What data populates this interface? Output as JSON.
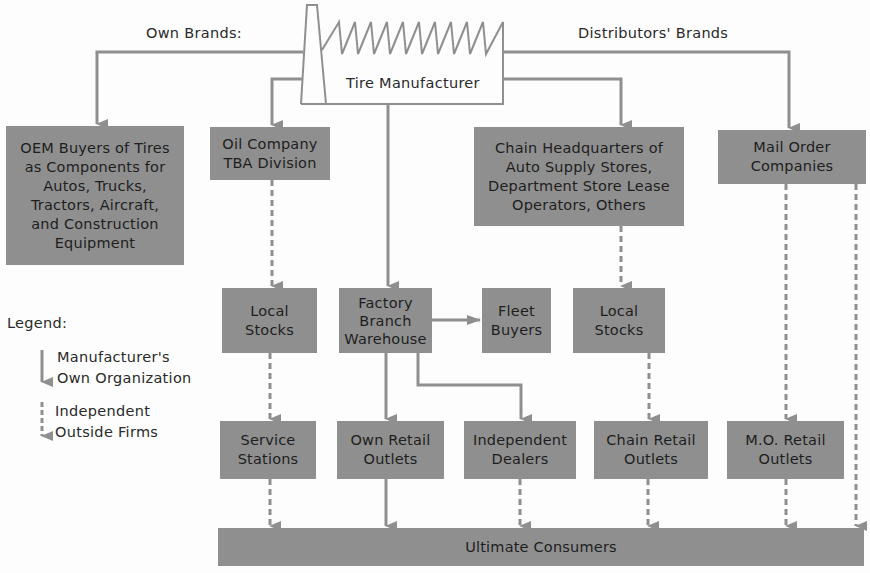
{
  "diagram": {
    "type": "flowchart",
    "colors": {
      "box_fill": "#8f8f8f",
      "line": "#8f8f8f",
      "text": "#2a2a2a",
      "background": "#fdfdfd"
    },
    "source": {
      "id": "tire-manufacturer",
      "label": "Tire Manufacturer",
      "icon": "factory-icon"
    },
    "branch_labels": {
      "own_brands": "Own Brands:",
      "distributors_brands": "Distributors' Brands"
    },
    "nodes": [
      {
        "id": "oem",
        "label": "OEM Buyers of Tires\nas Components for\nAutos, Trucks,\nTractors, Aircraft,\nand Construction\nEquipment"
      },
      {
        "id": "oil-company",
        "label": "Oil Company\nTBA Division"
      },
      {
        "id": "chain-hq",
        "label": "Chain Headquarters of\nAuto Supply Stores,\nDepartment Store Lease\nOperators, Others"
      },
      {
        "id": "mail-order",
        "label": "Mail Order\nCompanies"
      },
      {
        "id": "local-stocks-oil",
        "label": "Local\nStocks"
      },
      {
        "id": "factory-branch",
        "label": "Factory\nBranch\nWarehouse"
      },
      {
        "id": "fleet-buyers",
        "label": "Fleet\nBuyers"
      },
      {
        "id": "local-stocks-chain",
        "label": "Local\nStocks"
      },
      {
        "id": "service-stations",
        "label": "Service\nStations"
      },
      {
        "id": "own-retail",
        "label": "Own Retail\nOutlets"
      },
      {
        "id": "independent-dealers",
        "label": "Independent\nDealers"
      },
      {
        "id": "chain-retail",
        "label": "Chain Retail\nOutlets"
      },
      {
        "id": "mo-retail",
        "label": "M.O. Retail\nOutlets"
      },
      {
        "id": "ultimate-consumers",
        "label": "Ultimate Consumers"
      }
    ],
    "edges": [
      {
        "from": "tire-manufacturer",
        "to": "oem",
        "style": "solid",
        "group": "Own Brands"
      },
      {
        "from": "tire-manufacturer",
        "to": "oil-company",
        "style": "solid"
      },
      {
        "from": "tire-manufacturer",
        "to": "factory-branch",
        "style": "solid"
      },
      {
        "from": "tire-manufacturer",
        "to": "chain-hq",
        "style": "solid"
      },
      {
        "from": "tire-manufacturer",
        "to": "mail-order",
        "style": "solid",
        "group": "Distributors' Brands"
      },
      {
        "from": "oil-company",
        "to": "local-stocks-oil",
        "style": "dashed"
      },
      {
        "from": "local-stocks-oil",
        "to": "service-stations",
        "style": "dashed"
      },
      {
        "from": "factory-branch",
        "to": "fleet-buyers",
        "style": "solid"
      },
      {
        "from": "factory-branch",
        "to": "own-retail",
        "style": "solid"
      },
      {
        "from": "factory-branch",
        "to": "independent-dealers",
        "style": "solid"
      },
      {
        "from": "chain-hq",
        "to": "local-stocks-chain",
        "style": "dashed"
      },
      {
        "from": "local-stocks-chain",
        "to": "chain-retail",
        "style": "dashed"
      },
      {
        "from": "mail-order",
        "to": "mo-retail",
        "style": "dashed"
      },
      {
        "from": "mail-order",
        "to": "ultimate-consumers",
        "style": "dashed"
      },
      {
        "from": "service-stations",
        "to": "ultimate-consumers",
        "style": "dashed"
      },
      {
        "from": "own-retail",
        "to": "ultimate-consumers",
        "style": "solid"
      },
      {
        "from": "independent-dealers",
        "to": "ultimate-consumers",
        "style": "dashed"
      },
      {
        "from": "chain-retail",
        "to": "ultimate-consumers",
        "style": "dashed"
      },
      {
        "from": "mo-retail",
        "to": "ultimate-consumers",
        "style": "dashed"
      }
    ],
    "legend": {
      "title": "Legend:",
      "items": [
        {
          "style": "solid",
          "icon": "solid-arrow-icon",
          "label": "Manufacturer's\nOwn Organization"
        },
        {
          "style": "dashed",
          "icon": "dashed-arrow-icon",
          "label": "Independent\nOutside Firms"
        }
      ]
    }
  }
}
